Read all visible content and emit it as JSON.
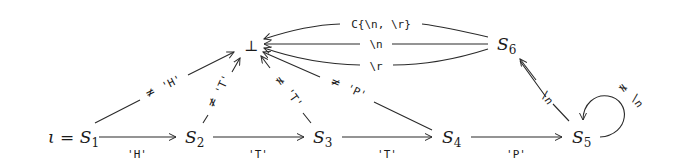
{
  "diagram": {
    "type": "state-machine",
    "nodes": [
      {
        "id": "S1",
        "label": "S",
        "sub": "1",
        "prefix": "ι = ",
        "initial": true
      },
      {
        "id": "S2",
        "label": "S",
        "sub": "2"
      },
      {
        "id": "S3",
        "label": "S",
        "sub": "3"
      },
      {
        "id": "S4",
        "label": "S",
        "sub": "4"
      },
      {
        "id": "S5",
        "label": "S",
        "sub": "5"
      },
      {
        "id": "S6",
        "label": "S",
        "sub": "6"
      },
      {
        "id": "bottom",
        "label": "⊥"
      }
    ],
    "edges": [
      {
        "from": "S1",
        "to": "S2",
        "label": "'H'",
        "negated": false
      },
      {
        "from": "S2",
        "to": "S3",
        "label": "'T'",
        "negated": false
      },
      {
        "from": "S3",
        "to": "S4",
        "label": "'T'",
        "negated": false
      },
      {
        "from": "S4",
        "to": "S5",
        "label": "'P'",
        "negated": false
      },
      {
        "from": "S5",
        "to": "S6",
        "label": "\\n",
        "negated": false
      },
      {
        "from": "S5",
        "to": "S5",
        "label": "\\n",
        "negated": true
      },
      {
        "from": "S1",
        "to": "bottom",
        "label": "'H'",
        "negated": true
      },
      {
        "from": "S2",
        "to": "bottom",
        "label": "'T'",
        "negated": true
      },
      {
        "from": "S3",
        "to": "bottom",
        "label": "'T'",
        "negated": true
      },
      {
        "from": "S4",
        "to": "bottom",
        "label": "'P'",
        "negated": true
      },
      {
        "from": "S6",
        "to": "bottom",
        "label": "C{\\n, \\r}",
        "negated": false
      },
      {
        "from": "S6",
        "to": "bottom",
        "label": "\\n",
        "negated": false
      },
      {
        "from": "S6",
        "to": "bottom",
        "label": "\\r",
        "negated": false
      }
    ],
    "neq_symbol": "≠"
  }
}
